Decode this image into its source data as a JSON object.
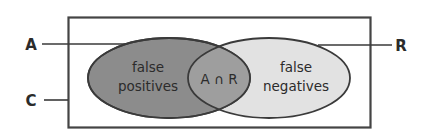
{
  "diagram": {
    "type": "venn-two-set",
    "universe": {
      "label": "C",
      "shape": "rectangle",
      "border_color": "#444444",
      "fill_color": "#ffffff"
    },
    "sets": [
      {
        "id": "A",
        "label": "A",
        "region_label_line1": "false",
        "region_label_line2": "positives",
        "fill_color": "#8c8c8c",
        "border_color": "#3a3a3a"
      },
      {
        "id": "R",
        "label": "R",
        "region_label_line1": "false",
        "region_label_line2": "negatives",
        "fill_color": "#e2e2e2",
        "border_color": "#3a3a3a"
      }
    ],
    "intersection": {
      "label": "A ∩ R",
      "fill_color": "#9e9e9e"
    },
    "leader_lines": [
      {
        "name": "leader-a",
        "from_label": "A"
      },
      {
        "name": "leader-c",
        "from_label": "C"
      },
      {
        "name": "leader-r",
        "from_label": "R"
      }
    ]
  }
}
